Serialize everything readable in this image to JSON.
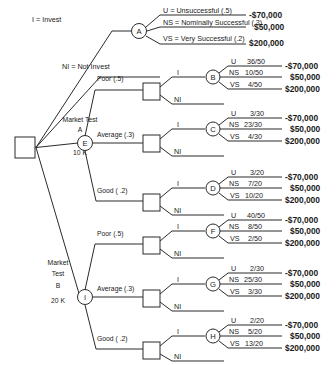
{
  "diagram": {
    "root": {
      "name": "root-decision-node",
      "shape": "square"
    },
    "legend": {
      "invest_label": "I = Invest",
      "not_invest_label": "NI = Not Invest",
      "outcome_u": "U = Unsuccessful (.5)",
      "outcome_ns": "NS = Nominally Successful (.3)",
      "outcome_vs": "VS = Very  Successful (.2)"
    },
    "payoffs": {
      "u": "-$70,000",
      "ns": "$50,000",
      "vs": "$200,000"
    },
    "branch_labels": {
      "invest": "I",
      "not_invest": "NI"
    },
    "test_a": {
      "line1": "Market Test",
      "line2": "A",
      "cost": "10 K",
      "node": "E"
    },
    "test_b": {
      "line1": "Market",
      "line2": "Test",
      "line3": "B",
      "cost": "20 K",
      "node": "I"
    },
    "survey_results": [
      {
        "label": "Poor  (.5)"
      },
      {
        "label": "Average (.3)"
      },
      {
        "label": "Good ( .2)"
      }
    ],
    "chance_nodes": [
      {
        "id": "A",
        "rows": [
          {
            "k": "U = Unsuccessful (.5)",
            "v": "-$70,000"
          },
          {
            "k": "NS = Nominally Successful (.3)",
            "v": "$50,000"
          },
          {
            "k": "VS = Very  Successful (.2)",
            "v": "$200,000"
          }
        ]
      },
      {
        "id": "B",
        "rows": [
          {
            "k": "U",
            "f": "36/50",
            "v": "-$70,000"
          },
          {
            "k": "NS",
            "f": "10/50",
            "v": "$50,000"
          },
          {
            "k": "VS",
            "f": "4/50",
            "v": "$200,000"
          }
        ]
      },
      {
        "id": "C",
        "rows": [
          {
            "k": "U",
            "f": "3/30",
            "v": "-$70,000"
          },
          {
            "k": "NS",
            "f": "23/30",
            "v": "$50,000"
          },
          {
            "k": "VS",
            "f": "4/30",
            "v": "$200,000"
          }
        ]
      },
      {
        "id": "D",
        "rows": [
          {
            "k": "U",
            "f": "3/20",
            "v": "-$70,000"
          },
          {
            "k": "NS",
            "f": "7/20",
            "v": "$50,000"
          },
          {
            "k": "VS",
            "f": "10/20",
            "v": "$200,000"
          }
        ]
      },
      {
        "id": "F",
        "rows": [
          {
            "k": "U",
            "f": "40/50",
            "v": "-$70,000"
          },
          {
            "k": "NS",
            "f": "8/50",
            "v": "$50,000"
          },
          {
            "k": "VS",
            "f": "2/50",
            "v": "$200,000"
          }
        ]
      },
      {
        "id": "G",
        "rows": [
          {
            "k": "U",
            "f": "2/30",
            "v": "-$70,000"
          },
          {
            "k": "NS",
            "f": "25/30",
            "v": "$50,000"
          },
          {
            "k": "VS",
            "f": "3/30",
            "v": "$200,000"
          }
        ]
      },
      {
        "id": "H",
        "rows": [
          {
            "k": "U",
            "f": "2/20",
            "v": "-$70,000"
          },
          {
            "k": "NS",
            "f": "5/20",
            "v": "$50,000"
          },
          {
            "k": "VS",
            "f": "13/20",
            "v": "$200,000"
          }
        ]
      }
    ],
    "colors": {
      "ink": "#2b2b2b",
      "background": "#ffffff"
    }
  }
}
